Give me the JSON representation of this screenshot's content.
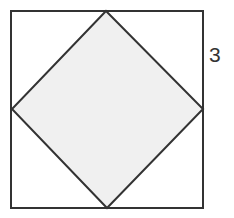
{
  "diagram": {
    "type": "geometry-figure",
    "outer_square": {
      "x1": 11,
      "y1": 11,
      "x2": 203,
      "y2": 208,
      "stroke": "#333333",
      "fill": "#ffffff"
    },
    "inner_diamond": {
      "points": [
        [
          106,
          11
        ],
        [
          203,
          109
        ],
        [
          107,
          208
        ],
        [
          12,
          109
        ]
      ],
      "stroke": "#333333",
      "fill": "#f0f0f0"
    },
    "labels": [
      {
        "text": "3",
        "x": 209,
        "y": 62,
        "refers_to": "upper half of right side of outer square"
      }
    ]
  }
}
